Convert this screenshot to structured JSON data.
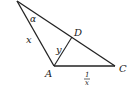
{
  "figure": {
    "type": "geometry",
    "stroke_color": "#222222",
    "background": "#ffffff",
    "points": {
      "top": [
        17,
        1
      ],
      "A": [
        54,
        66
      ],
      "C": [
        115,
        66
      ],
      "D": [
        72,
        37
      ]
    },
    "labels": {
      "vertex_A": "A",
      "vertex_C": "C",
      "vertex_D": "D",
      "angle_alpha": "α",
      "side_x": "x",
      "side_y": "y",
      "side_AC_numerator": "1",
      "side_AC_denominator": "x"
    }
  }
}
